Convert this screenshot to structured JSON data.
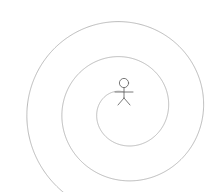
{
  "canvas": {
    "width": 217,
    "height": 192,
    "background_color": "#ffffff",
    "title": "Spiral with stick figure at center"
  },
  "style": {
    "spiral_stroke_color": "#a8a8a8",
    "spiral_stroke_width": 0.8,
    "figure_stroke_color": "#6b6b6b",
    "figure_stroke_width": 0.9
  },
  "spiral": {
    "name": "archimedean-spiral",
    "center_x": 124,
    "center_y": 110,
    "turns": 2.45,
    "start_radius": 18,
    "end_radius": 104,
    "start_angle_deg": 90,
    "direction": "counterclockwise",
    "outer_end_x": 20,
    "outer_end_y": 118,
    "top_extent_y": 14,
    "right_extent_x": 201,
    "bottom_extent_y": 181
  },
  "figure": {
    "name": "stick-figure",
    "center_x": 124,
    "head_center_y": 83,
    "head_radius": 4.6,
    "body_top_y": 88,
    "body_bottom_y": 98,
    "arm_y": 92,
    "arm_half_width": 9,
    "leg_spread": 6,
    "leg_bottom_y": 105
  }
}
